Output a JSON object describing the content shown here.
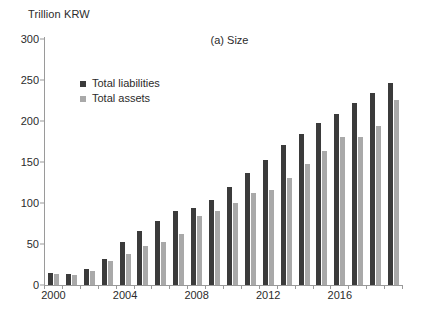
{
  "chart_data": {
    "type": "bar",
    "title": "(a) Size",
    "ylabel": "Trillion KRW",
    "xlabel": "",
    "ylim": [
      0,
      300
    ],
    "yticks": [
      0,
      50,
      100,
      150,
      200,
      250,
      300
    ],
    "xticks_shown": [
      "2000",
      "2004",
      "2008",
      "2012",
      "2016"
    ],
    "grid": false,
    "legend_position": "upper-left-inside",
    "categories": [
      "2000",
      "2001",
      "2002",
      "2003",
      "2004",
      "2005",
      "2006",
      "2007",
      "2008",
      "2009",
      "2010",
      "2011",
      "2012",
      "2013",
      "2014",
      "2015",
      "2016",
      "2017",
      "2018",
      "2019"
    ],
    "series": [
      {
        "name": "Total liabilities",
        "color": "#3b3b3b",
        "values": [
          15,
          14,
          20,
          32,
          52,
          66,
          78,
          90,
          94,
          104,
          119,
          136,
          152,
          171,
          184,
          197,
          208,
          222,
          234,
          246
        ]
      },
      {
        "name": "Total assets",
        "color": "#a9a9a9",
        "values": [
          13,
          12,
          17,
          29,
          38,
          48,
          52,
          62,
          84,
          90,
          100,
          112,
          116,
          130,
          147,
          164,
          180,
          181,
          194,
          226
        ]
      }
    ]
  }
}
